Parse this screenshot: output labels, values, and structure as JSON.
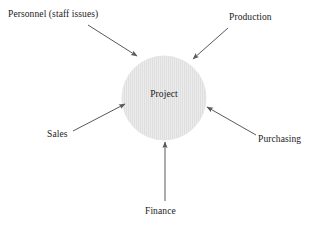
{
  "diagram": {
    "center": {
      "label": "Project",
      "shape": "circle",
      "fill_color": "#e8e8e8",
      "pattern": "vertical-stripes",
      "stripe_color": "#dcdcdc",
      "cx": 164,
      "cy": 98,
      "r": 42
    },
    "arrow_color": "#595959",
    "text_color": "#1a1a1a",
    "background_color": "#ffffff",
    "nodes": [
      {
        "id": "personnel",
        "label": "Personnel (staff issues)",
        "position": "top-left",
        "arrow": {
          "x1": 88,
          "y1": 25,
          "x2": 137,
          "y2": 56
        }
      },
      {
        "id": "production",
        "label": "Production",
        "position": "top-right",
        "arrow": {
          "x1": 228,
          "y1": 28,
          "x2": 193,
          "y2": 59
        }
      },
      {
        "id": "sales",
        "label": "Sales",
        "position": "left",
        "arrow": {
          "x1": 73,
          "y1": 131,
          "x2": 125,
          "y2": 104
        }
      },
      {
        "id": "purchasing",
        "label": "Purchasing",
        "position": "right",
        "arrow": {
          "x1": 256,
          "y1": 135,
          "x2": 207,
          "y2": 107
        }
      },
      {
        "id": "finance",
        "label": "Finance",
        "position": "bottom",
        "arrow": {
          "x1": 165,
          "y1": 201,
          "x2": 165,
          "y2": 142
        }
      }
    ]
  }
}
